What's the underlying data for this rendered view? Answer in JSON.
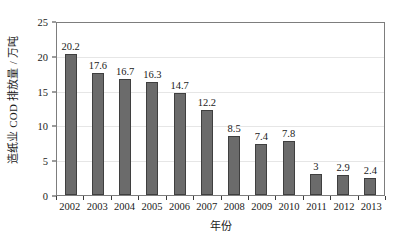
{
  "chart_data": {
    "type": "bar",
    "title": "",
    "xlabel": "年份",
    "ylabel": "造纸业 COD 排放量 / 万吨",
    "categories": [
      "2002",
      "2003",
      "2004",
      "2005",
      "2006",
      "2007",
      "2008",
      "2009",
      "2010",
      "2011",
      "2012",
      "2013"
    ],
    "values": [
      20.2,
      17.6,
      16.7,
      16.3,
      14.7,
      12.2,
      8.5,
      7.4,
      7.8,
      3,
      2.9,
      2.4
    ],
    "value_labels": [
      "20.2",
      "17.6",
      "16.7",
      "16.3",
      "14.7",
      "12.2",
      "8.5",
      "7.4",
      "7.8",
      "3",
      "2.9",
      "2.4"
    ],
    "ylim": [
      0,
      25
    ],
    "yticks": [
      0,
      5,
      10,
      15,
      20,
      25
    ],
    "ytick_labels": [
      "0",
      "5",
      "10",
      "15",
      "20",
      "25"
    ],
    "grid": true,
    "grid_axis": "y",
    "legend": false,
    "legend_position": "none",
    "series": [
      {
        "name": "造纸业 COD 排放量",
        "values": [
          20.2,
          17.6,
          16.7,
          16.3,
          14.7,
          12.2,
          8.5,
          7.4,
          7.8,
          3,
          2.9,
          2.4
        ]
      }
    ],
    "colors": {
      "bar_fill": "#6b6b6b",
      "bar_edge": "#3f3f3f",
      "gridline": "#e6e6e6",
      "axis": "#7d7d7d",
      "text": "#1a1a1a",
      "background": "#ffffff"
    }
  }
}
